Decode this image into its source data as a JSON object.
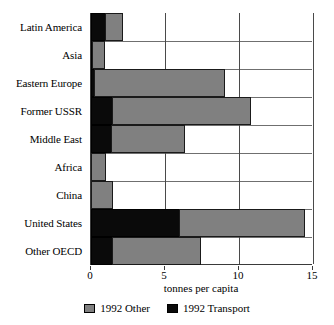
{
  "chart_data": {
    "type": "bar",
    "orientation": "horizontal",
    "stacked": true,
    "title": "",
    "xlabel": "tonnes per capita",
    "ylabel": "",
    "xlim": [
      0,
      15
    ],
    "xticks": [
      0,
      5,
      10,
      15
    ],
    "xtick_labels": [
      "0",
      "5",
      "10",
      "15"
    ],
    "grid": "vertical-and-horizontal",
    "legend_position": "bottom-center",
    "categories": [
      "Latin America",
      "Asia",
      "Eastern Europe",
      "Former USSR",
      "Middle East",
      "Africa",
      "China",
      "United States",
      "Other OECD"
    ],
    "series": [
      {
        "name": "1992 Transport",
        "color": "#0a0a0a",
        "values": [
          1.0,
          0.1,
          0.3,
          1.5,
          1.4,
          0.0,
          0.0,
          6.0,
          1.5
        ]
      },
      {
        "name": "1992 Other",
        "color": "#808080",
        "values": [
          1.2,
          0.9,
          8.8,
          9.4,
          5.0,
          1.0,
          1.5,
          8.5,
          6.0
        ]
      }
    ],
    "totals": [
      2.2,
      1.0,
      9.1,
      10.9,
      6.4,
      1.0,
      1.5,
      14.5,
      7.5
    ]
  },
  "axis": {
    "x_title": "tonnes per capita",
    "ticks": [
      "0",
      "5",
      "10",
      "15"
    ]
  },
  "legend": {
    "entries": [
      {
        "label": "1992 Other",
        "swatch": "other-swatch"
      },
      {
        "label": "1992 Transport",
        "swatch": "transport-swatch"
      }
    ]
  }
}
